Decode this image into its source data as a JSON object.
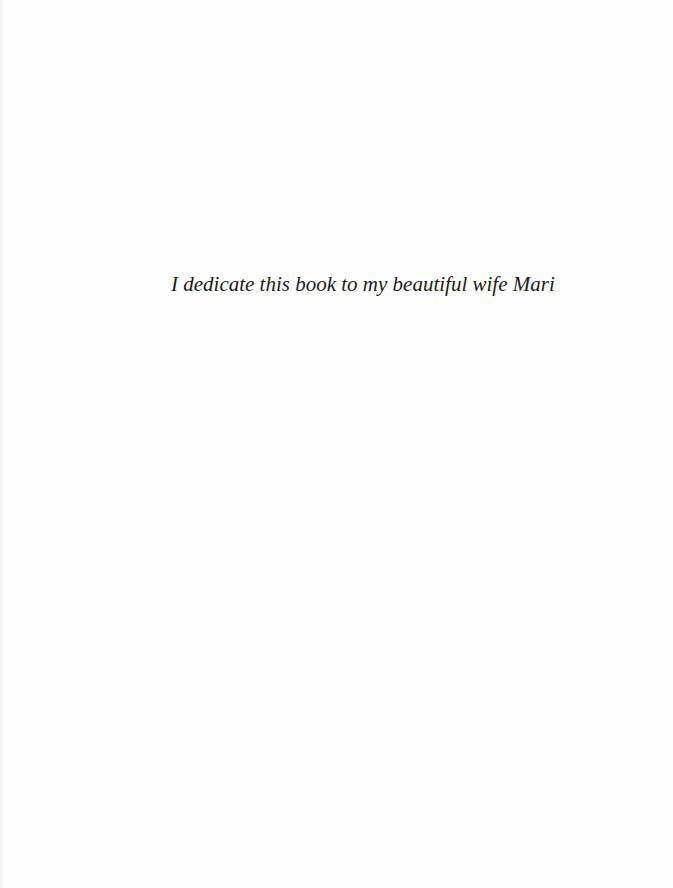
{
  "page": {
    "dedication": "I dedicate this book to my beautiful wife Mari"
  }
}
